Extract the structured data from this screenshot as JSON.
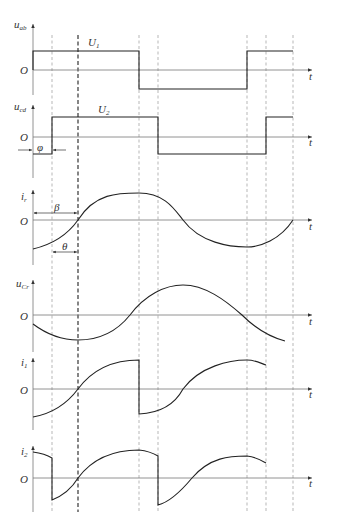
{
  "figure": {
    "origin_label": "O",
    "time_axis_label": "t"
  },
  "panels": [
    {
      "id": "u_ab",
      "var": "u",
      "sub": "ab",
      "level_label": "U",
      "level_sub": "1"
    },
    {
      "id": "u_cd",
      "var": "u",
      "sub": "cd",
      "level_label": "U",
      "level_sub": "2",
      "phase_label": "φ"
    },
    {
      "id": "i_r",
      "var": "i",
      "sub": "r",
      "angle_labels": [
        "β",
        "θ"
      ]
    },
    {
      "id": "u_Cr",
      "var": "u",
      "sub": "Cr"
    },
    {
      "id": "i_1",
      "var": "i",
      "sub": "1"
    },
    {
      "id": "i_2",
      "var": "i",
      "sub": "2"
    }
  ],
  "colors": {
    "waveform": "#222222",
    "axis": "#777777",
    "guide": "#888888"
  }
}
